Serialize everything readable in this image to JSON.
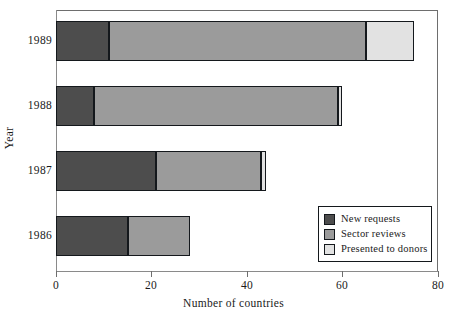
{
  "chart_data": {
    "type": "bar",
    "orientation": "horizontal",
    "stacked": true,
    "title": "",
    "xlabel": "Number of countries",
    "ylabel": "Year",
    "categories": [
      "1989",
      "1988",
      "1987",
      "1986"
    ],
    "xlim": [
      0,
      80
    ],
    "xticks": [
      0,
      20,
      40,
      60,
      80
    ],
    "xticklabels": [
      "0",
      "20",
      "40",
      "60",
      "80"
    ],
    "grid": false,
    "legend_position": "lower right",
    "series": [
      {
        "name": "New requests",
        "color": "#4d4d4d",
        "values": [
          11,
          8,
          21,
          15
        ]
      },
      {
        "name": "Sector reviews",
        "color": "#9b9b9b",
        "values": [
          54,
          51,
          22,
          13
        ]
      },
      {
        "name": "Presented to donors",
        "color": "#e2e2e2",
        "values": [
          10,
          1,
          1,
          0
        ]
      }
    ],
    "cumulative_ends": {
      "1989": [
        11,
        65,
        75
      ],
      "1988": [
        8,
        59,
        60
      ],
      "1987": [
        21,
        43,
        44
      ],
      "1986": [
        15,
        28,
        28
      ]
    }
  },
  "legend": {
    "items": [
      {
        "label": "New requests",
        "color": "#4d4d4d"
      },
      {
        "label": "Sector reviews",
        "color": "#9b9b9b"
      },
      {
        "label": "Presented to donors",
        "color": "#e2e2e2"
      }
    ]
  },
  "axes": {
    "x_title": "Number of countries",
    "y_title": "Year",
    "x_ticks": [
      "0",
      "20",
      "40",
      "60",
      "80"
    ],
    "y_ticks": [
      "1989",
      "1988",
      "1987",
      "1986"
    ]
  }
}
